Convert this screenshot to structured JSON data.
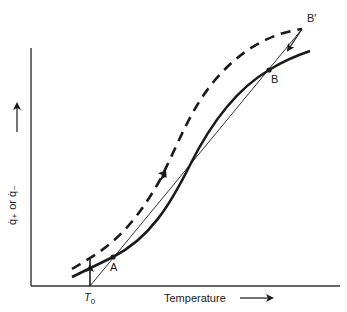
{
  "figure": {
    "x_axis_label": "Temperature",
    "y_axis_label": "q̇₊ or q̇₋",
    "tick_label_T0": "T",
    "tick_label_T0_sub": "0",
    "points": {
      "A": "A",
      "B": "B",
      "B_prime": "B′"
    },
    "curves": [
      {
        "name": "heat-generation-curve",
        "style": "solid-thick",
        "description": "S-shaped curve passing through A and B"
      },
      {
        "name": "heat-loss-line",
        "style": "solid-thin",
        "description": "straight line from T0 through A toward B′"
      },
      {
        "name": "trajectory-curve",
        "style": "dashed",
        "description": "dashed path from T0 rising to B′ then arrow down to B"
      }
    ]
  }
}
